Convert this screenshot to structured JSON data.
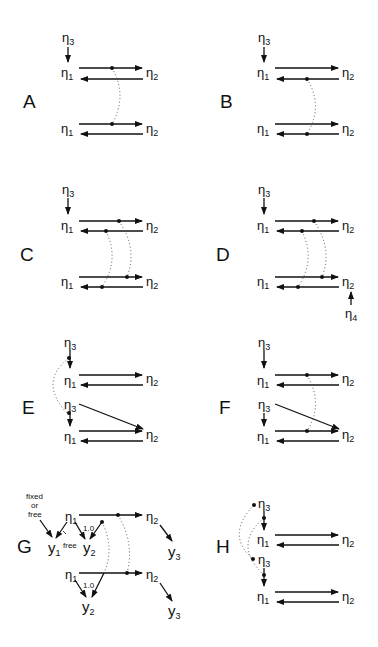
{
  "figure": {
    "panels": [
      {
        "id": "A",
        "label": "A"
      },
      {
        "id": "B",
        "label": "B"
      },
      {
        "id": "C",
        "label": "C"
      },
      {
        "id": "D",
        "label": "D"
      },
      {
        "id": "E",
        "label": "E"
      },
      {
        "id": "F",
        "label": "F"
      },
      {
        "id": "G",
        "label": "G"
      },
      {
        "id": "H",
        "label": "H"
      }
    ],
    "nodes": {
      "eta": "η",
      "y": "y",
      "sub1": "1",
      "sub2": "2",
      "sub3": "3",
      "sub4": "4"
    },
    "annotations": {
      "fixed": "fixed",
      "or": "or",
      "free": "free",
      "free_small": "free",
      "loading_fixed_1": "1.0",
      "loading_fixed_2": "1.0"
    },
    "colors": {
      "ink": "#111111",
      "dotted": "#555555",
      "background": "#ffffff"
    }
  }
}
